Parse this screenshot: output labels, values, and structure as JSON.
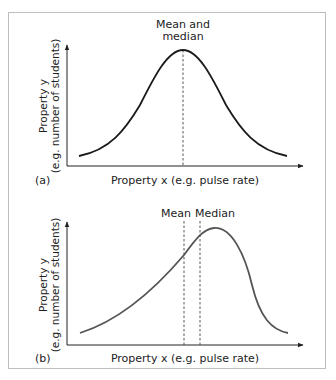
{
  "figure": {
    "panels": [
      {
        "id": "a",
        "panel_label": "(a)",
        "title_line1": "Mean and",
        "title_line2": "median",
        "y_axis_label_line1": "Property y",
        "y_axis_label_line2": "(e.g. number of students)",
        "x_axis_label": "Property x (e.g. pulse rate)",
        "curve_color": "#1a1a1a",
        "shape": "symmetric normal distribution"
      },
      {
        "id": "b",
        "panel_label": "(b)",
        "mean_label": "Mean",
        "median_label": "Median",
        "y_axis_label_line1": "Property y",
        "y_axis_label_line2": "(e.g. number of students)",
        "x_axis_label": "Property x (e.g. pulse rate)",
        "curve_color": "#555555",
        "shape": "negatively skewed distribution"
      }
    ]
  },
  "colors": {
    "frame_border": "#bdbdbd",
    "axis": "#222222",
    "dashed_line": "#444444"
  }
}
